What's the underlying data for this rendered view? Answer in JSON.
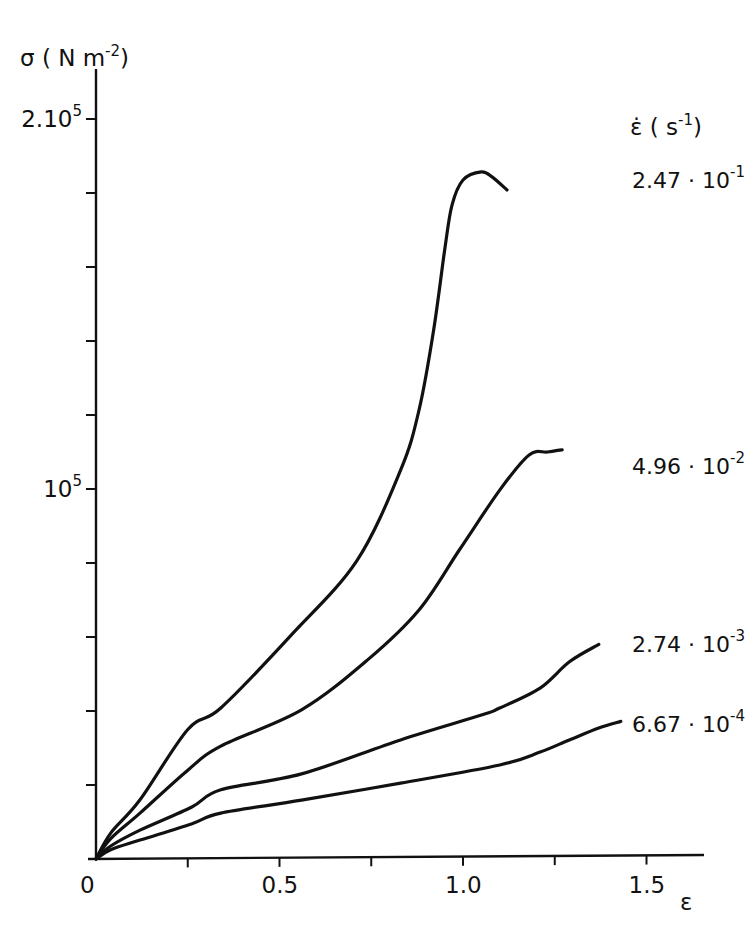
{
  "chart_data": {
    "type": "line",
    "title": "",
    "xlabel": "ε",
    "ylabel": {
      "base": "σ ( N m",
      "sup": "-2",
      "close": ")"
    },
    "legend_title": {
      "symbol": "ε̇",
      "unit_open": " ( s",
      "unit_sup": "-1",
      "unit_close": ")"
    },
    "xlim": [
      0,
      1.65
    ],
    "ylim": [
      0,
      210000
    ],
    "x_ticks_minor": [
      0.25,
      0.5,
      0.75,
      1.0,
      1.25,
      1.5
    ],
    "x_tick_labels": [
      {
        "value": 0,
        "label": "0"
      },
      {
        "value": 0.5,
        "label": "0.5"
      },
      {
        "value": 1.0,
        "label": "1.0"
      },
      {
        "value": 1.5,
        "label": "1.5"
      }
    ],
    "y_ticks_minor": [
      20000,
      40000,
      60000,
      80000,
      100000,
      120000,
      140000,
      160000,
      180000,
      200000
    ],
    "y_tick_labels": [
      {
        "value": 100000,
        "base": "10",
        "sup": "5"
      },
      {
        "value": 200000,
        "base": "2.10",
        "sup": "5"
      }
    ],
    "grid": false,
    "legend_placement": "right, labels placed at curve ends",
    "series": [
      {
        "name": "2.47·10^-1",
        "label_base": "2.47 · 10",
        "label_sup": "-1",
        "x": [
          0,
          0.04,
          0.12,
          0.25,
          0.34,
          0.53,
          0.71,
          0.83,
          0.88,
          0.92,
          0.95,
          0.97,
          1.0,
          1.05,
          1.08,
          1.12
        ],
        "y": [
          0,
          7000,
          16000,
          35000,
          40800,
          60300,
          80500,
          105100,
          121300,
          142900,
          164500,
          176700,
          183500,
          185700,
          184300,
          180800
        ]
      },
      {
        "name": "4.96·10^-2",
        "label_base": "4.96 · 10",
        "label_sup": "-2",
        "x": [
          0,
          0.04,
          0.12,
          0.25,
          0.34,
          0.56,
          0.74,
          0.88,
          0.99,
          1.1,
          1.18,
          1.23,
          1.27
        ],
        "y": [
          0,
          5500,
          12400,
          24000,
          30500,
          40300,
          53800,
          67300,
          83500,
          99700,
          109200,
          110000,
          110600
        ]
      },
      {
        "name": "2.74·10^-3",
        "label_base": "2.74 · 10",
        "label_sup": "-3",
        "x": [
          0,
          0.04,
          0.12,
          0.26,
          0.34,
          0.56,
          0.83,
          1.05,
          1.1,
          1.21,
          1.29,
          1.37
        ],
        "y": [
          0,
          3500,
          7800,
          14000,
          18700,
          23000,
          32200,
          38900,
          40800,
          46200,
          53300,
          58000
        ]
      },
      {
        "name": "6.67·10^-4",
        "label_base": "6.67 · 10",
        "label_sup": "-4",
        "x": [
          0,
          0.04,
          0.12,
          0.26,
          0.34,
          0.56,
          0.83,
          1.1,
          1.21,
          1.29,
          1.37,
          1.43
        ],
        "y": [
          0,
          2500,
          5100,
          9500,
          12400,
          15900,
          20500,
          25400,
          28900,
          32200,
          35400,
          37200
        ]
      }
    ]
  }
}
